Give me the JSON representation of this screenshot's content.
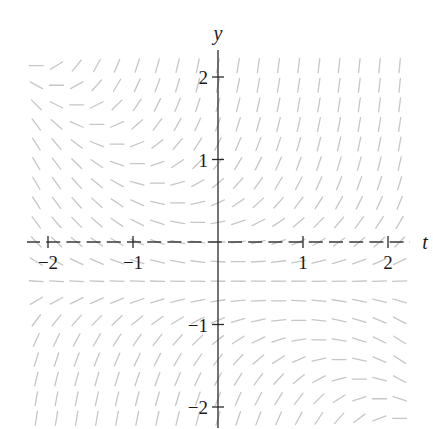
{
  "figure": {
    "width": 433,
    "height": 429,
    "colors": {
      "background": "#ffffff",
      "slope_marks": "#c6c6c6",
      "axes": "#3a3a3a",
      "text": "#1a1a1a"
    }
  },
  "chart_data": {
    "type": "slope_field",
    "title": "",
    "xlabel": "t",
    "ylabel": "y",
    "slope_function": "(y + 0.5) * (y + t)",
    "equilibrium_line_y": -0.5,
    "xlim": [
      -2.15,
      2.3
    ],
    "ylim": [
      -2.2,
      2.3
    ],
    "grid": {
      "cols": 19,
      "rows": 19,
      "t_min": -2.1375,
      "t_max": 2.1375,
      "y_min": -2.1375,
      "y_max": 2.1375,
      "mark_length_px": 14
    },
    "xticks": [
      {
        "value": -2,
        "label": "−2"
      },
      {
        "value": -1,
        "label": "−1"
      },
      {
        "value": 1,
        "label": "1"
      },
      {
        "value": 2,
        "label": "2"
      }
    ],
    "yticks": [
      {
        "value": 2,
        "label": "2"
      },
      {
        "value": 1,
        "label": "1"
      },
      {
        "value": -1,
        "label": "−1"
      },
      {
        "value": -2,
        "label": "−2"
      }
    ],
    "grid_lines": false,
    "legend": null
  },
  "layout": {
    "origin_px": [
      218,
      242
    ],
    "px_per_unit_x": 85,
    "px_per_unit_y": 82.5,
    "x_axis_px": [
      27,
      410
    ],
    "y_axis_px": [
      50,
      428
    ]
  }
}
